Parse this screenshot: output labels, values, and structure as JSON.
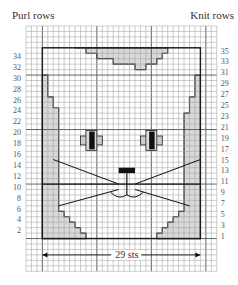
{
  "chart": {
    "title_left": "Purl rows",
    "title_right": "Knit rows",
    "width_label": "29 sts",
    "stitches": 29,
    "rows": 35,
    "left_row_numbers": [
      "34",
      "32",
      "30",
      "28",
      "26",
      "24",
      "22",
      "20",
      "18",
      "16",
      "14",
      "12",
      "10",
      "8",
      "6",
      "4",
      "2"
    ],
    "right_row_numbers": [
      "35",
      "33",
      "31",
      "29",
      "27",
      "25",
      "23",
      "21",
      "19",
      "17",
      "15",
      "13",
      "11",
      "9",
      "7",
      "5",
      "3",
      "1"
    ],
    "motif": "cat face",
    "colors": {
      "grid_line": "#9a9a9a",
      "outline": "#1a1a1a",
      "shaded": "#d9d9d9",
      "background": "#ffffff"
    }
  }
}
